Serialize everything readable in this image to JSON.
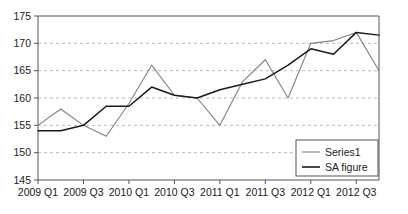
{
  "chart_data": {
    "type": "line",
    "title": "",
    "xlabel": "",
    "ylabel": "",
    "ylim": [
      145,
      175
    ],
    "yticks": [
      145,
      150,
      155,
      160,
      165,
      170,
      175
    ],
    "grid": true,
    "grid_style": "dashed-horizontal",
    "legend_position": "bottom-right",
    "x": [
      "2009 Q1",
      "2009 Q2",
      "2009 Q3",
      "2009 Q4",
      "2010 Q1",
      "2010 Q2",
      "2010 Q3",
      "2010 Q4",
      "2011 Q1",
      "2011 Q2",
      "2011 Q3",
      "2011 Q4",
      "2012 Q1",
      "2012 Q2",
      "2012 Q3",
      "2012 Q4"
    ],
    "xtick_labels": [
      "2009 Q1",
      "2009 Q3",
      "2010 Q1",
      "2010 Q3",
      "2011 Q1",
      "2011 Q3",
      "2012 Q1",
      "2012 Q3"
    ],
    "xtick_indices": [
      0,
      2,
      4,
      6,
      8,
      10,
      12,
      14
    ],
    "series": [
      {
        "name": "Series1",
        "color": "#808080",
        "values": [
          155.0,
          158.0,
          155.0,
          153.0,
          159.0,
          166.0,
          160.5,
          160.0,
          155.0,
          163.0,
          167.0,
          160.0,
          170.0,
          170.5,
          172.0,
          165.0
        ]
      },
      {
        "name": "SA figure",
        "color": "#1a1a1a",
        "values": [
          154.0,
          154.0,
          155.0,
          158.5,
          158.5,
          162.0,
          160.5,
          160.0,
          161.5,
          162.5,
          163.5,
          166.0,
          169.0,
          168.0,
          172.0,
          171.5
        ]
      }
    ]
  },
  "legend": {
    "items": [
      {
        "label": "Series1",
        "color": "#808080"
      },
      {
        "label": "SA figure",
        "color": "#1a1a1a"
      }
    ]
  },
  "axis": {
    "y_min_label": "145",
    "y_max_label": "175"
  }
}
